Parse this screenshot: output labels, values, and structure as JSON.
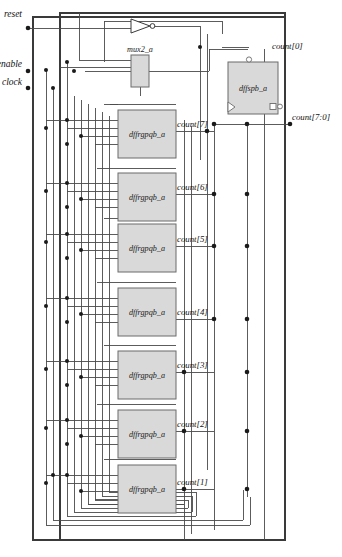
{
  "diagram": {
    "colors": {
      "wire": "#4a4a4a",
      "wire_dark": "#2b2b2b",
      "block_fill": "#d9d9d9",
      "block_stroke": "#6b6b6b",
      "text": "#111111",
      "background": "#ffffff"
    }
  },
  "inputs": [
    {
      "name": "reset-port",
      "label": "reset",
      "x": 22,
      "y": 28
    },
    {
      "name": "enable-port",
      "label": "enable",
      "x": 14,
      "y": 70
    },
    {
      "name": "clock-port",
      "label": "clock",
      "x": 18,
      "y": 88
    }
  ],
  "outputs": [
    {
      "name": "count0-port",
      "label": "count[0]",
      "x": 272,
      "y": 49
    },
    {
      "name": "countbus-port",
      "label": "count[7:0]",
      "x": 292,
      "y": 124
    }
  ],
  "blocks": [
    {
      "name": "mux2_a-block",
      "label": "mux2_a",
      "x": 131,
      "y": 55,
      "w": 18,
      "h": 32
    },
    {
      "name": "dffspb_a-block",
      "label": "dffspb_a",
      "x": 228,
      "y": 62,
      "w": 50,
      "h": 52
    },
    {
      "name": "dffrgpqb_a-block-7",
      "label": "dffrgpqb_a",
      "x": 118,
      "y": 110,
      "w": 58,
      "h": 48
    },
    {
      "name": "dffrgpqb_a-block-6",
      "label": "dffrgpqb_a",
      "x": 118,
      "y": 173,
      "w": 58,
      "h": 48
    },
    {
      "name": "dffrgpqb_a-block-5",
      "label": "dffrgpqb_a",
      "x": 118,
      "y": 224,
      "w": 58,
      "h": 48
    },
    {
      "name": "dffrgpqb_a-block-4",
      "label": "dffrgpqb_a",
      "x": 118,
      "y": 288,
      "w": 58,
      "h": 48
    },
    {
      "name": "dffrgpqb_a-block-3",
      "label": "dffrgpqb_a",
      "x": 118,
      "y": 351,
      "w": 58,
      "h": 48
    },
    {
      "name": "dffrgpqb_a-block-2",
      "label": "dffrgpqb_a",
      "x": 118,
      "y": 410,
      "w": 58,
      "h": 48
    },
    {
      "name": "dffrgpqb_a-block-1",
      "label": "dffrgpqb_a",
      "x": 118,
      "y": 465,
      "w": 58,
      "h": 48
    }
  ],
  "nets": [
    {
      "name": "count7-label",
      "label": "count[7]",
      "x": 176,
      "y": 125
    },
    {
      "name": "count6-label",
      "label": "count[6]",
      "x": 176,
      "y": 188
    },
    {
      "name": "count5-label",
      "label": "count[5]",
      "x": 176,
      "y": 240
    },
    {
      "name": "count4-label",
      "label": "count[4]",
      "x": 176,
      "y": 313
    },
    {
      "name": "count3-label",
      "label": "count[3]",
      "x": 176,
      "y": 366
    },
    {
      "name": "count2-label",
      "label": "count[2]",
      "x": 176,
      "y": 425
    },
    {
      "name": "count1-label",
      "label": "count[1]",
      "x": 176,
      "y": 483
    }
  ],
  "symbols": {
    "inverter": {
      "name": "inverter-gate",
      "x": 131,
      "y": 20,
      "w": 22,
      "h": 13
    },
    "clock_triangle": {
      "name": "clock-input-triangle"
    },
    "inversion_bubble": {
      "name": "inversion-bubble"
    }
  }
}
